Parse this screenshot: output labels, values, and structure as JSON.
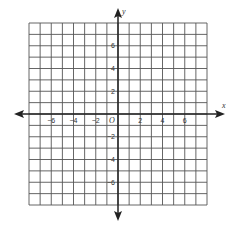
{
  "chart_data": {
    "type": "coordinate-grid",
    "title": "",
    "xlabel": "x",
    "ylabel": "y",
    "origin_label": "O",
    "xlim": [
      -8,
      8
    ],
    "ylim": [
      -8,
      8
    ],
    "grid": true,
    "grid_step": 1,
    "x_tick_labels": [
      {
        "value": -6,
        "text": "−6"
      },
      {
        "value": -4,
        "text": "−4"
      },
      {
        "value": -2,
        "text": "−2"
      },
      {
        "value": 2,
        "text": "2"
      },
      {
        "value": 4,
        "text": "4"
      },
      {
        "value": 6,
        "text": "6"
      }
    ],
    "y_tick_labels": [
      {
        "value": 6,
        "text": "6"
      },
      {
        "value": 4,
        "text": "4"
      },
      {
        "value": 2,
        "text": "2"
      },
      {
        "value": -2,
        "text": "−2"
      },
      {
        "value": -4,
        "text": "−4"
      },
      {
        "value": -6,
        "text": "−6"
      }
    ],
    "series": []
  },
  "colors": {
    "grid": "#555555",
    "axis": "#222222",
    "text": "#333333",
    "background": "#ffffff"
  }
}
